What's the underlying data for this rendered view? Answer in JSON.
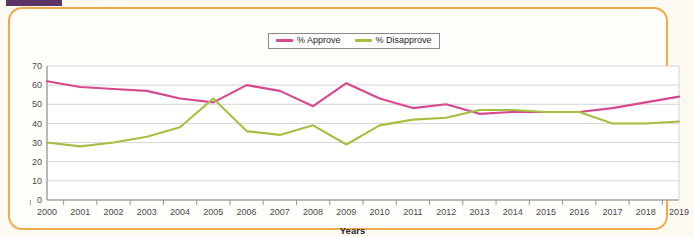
{
  "page": {
    "background_color": "#fdf9f0",
    "card_border_color": "#f0a94c",
    "top_bar_color": "#5c3566",
    "top_bar_ghost_text": "........"
  },
  "legend": {
    "position": "top-center",
    "items": [
      {
        "label": "% Approve",
        "color": "#d6488f"
      },
      {
        "label": "% Disapprove",
        "color": "#a5bf42"
      }
    ]
  },
  "axes": {
    "x_title": "Years",
    "y_title": "",
    "y_ticks": [
      "0",
      "10",
      "20",
      "30",
      "40",
      "50",
      "60",
      "70"
    ],
    "x_ticks": [
      "2000",
      "2001",
      "2002",
      "2003",
      "2004",
      "2005",
      "2006",
      "2007",
      "2008",
      "2009",
      "2010",
      "2011",
      "2012",
      "2013",
      "2014",
      "2015",
      "2016",
      "2017",
      "2018",
      "2019"
    ]
  },
  "chart_data": {
    "type": "line",
    "title": "",
    "subtitle": "",
    "xlabel": "Years",
    "ylabel": "",
    "xlim": [
      2000,
      2019
    ],
    "ylim": [
      0,
      70
    ],
    "grid": true,
    "legend_position": "top-center",
    "x": [
      2000,
      2001,
      2002,
      2003,
      2004,
      2005,
      2006,
      2007,
      2008,
      2009,
      2010,
      2011,
      2012,
      2013,
      2014,
      2015,
      2016,
      2017,
      2018,
      2019
    ],
    "series": [
      {
        "name": "% Approve",
        "color": "#d6488f",
        "values": [
          62,
          59,
          58,
          57,
          53,
          51,
          60,
          57,
          49,
          61,
          53,
          48,
          50,
          45,
          46,
          46,
          46,
          48,
          51,
          54
        ]
      },
      {
        "name": "% Disapprove",
        "color": "#a5bf42",
        "values": [
          30,
          28,
          30,
          33,
          38,
          53,
          36,
          34,
          39,
          29,
          39,
          42,
          43,
          47,
          47,
          46,
          46,
          40,
          40,
          41
        ]
      }
    ],
    "annotations": []
  }
}
